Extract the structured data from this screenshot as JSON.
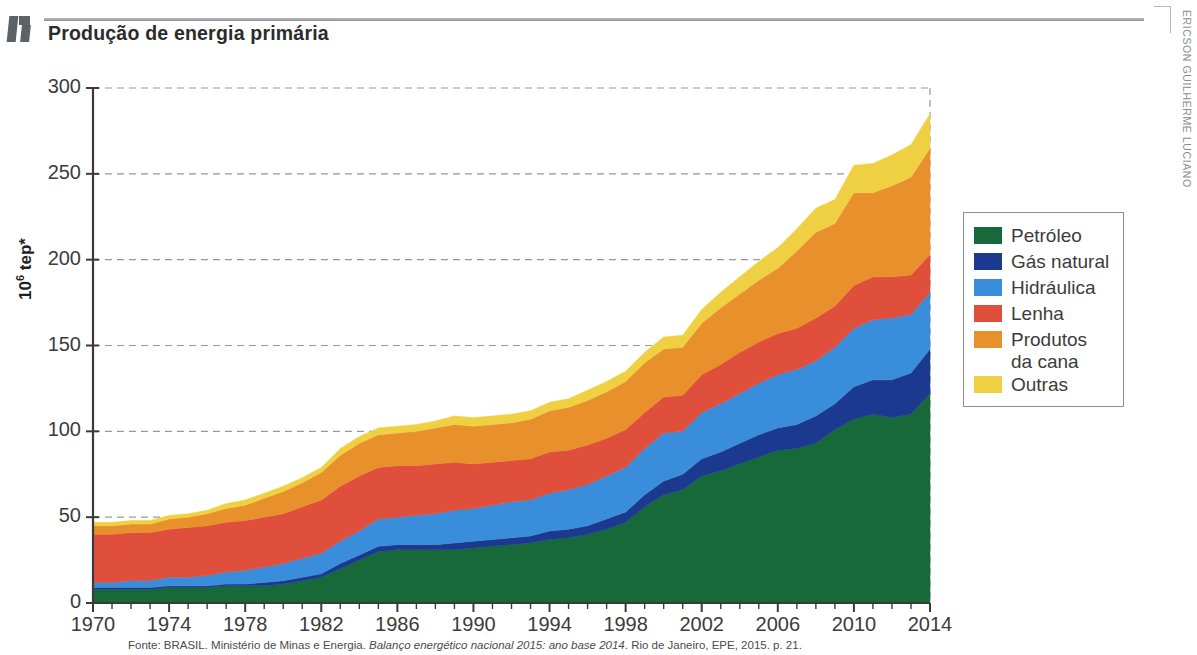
{
  "header": {
    "title": "Produção de energia primária",
    "corner_icon": "bookmark-corner-icon"
  },
  "credit": {
    "text": "ERICSON GUILHERME LUCIANO"
  },
  "source": {
    "prefix": "Fonte: BRASIL. Ministério de Minas e Energia. ",
    "italic": "Balanço energético nacional 2015: ano base 2014",
    "suffix": ". Rio de Janeiro, EPE, 2015. p. 21."
  },
  "legend": {
    "items": [
      {
        "label": "Petróleo",
        "color": "#17693a"
      },
      {
        "label": "Gás natural",
        "color": "#1b3a8f"
      },
      {
        "label": "Hidráulica",
        "color": "#3a8ddb"
      },
      {
        "label": "Lenha",
        "color": "#e04e3c"
      },
      {
        "label": "Produtos",
        "color": "#e8912c",
        "cont": "da cana"
      },
      {
        "label": "Outras",
        "color": "#f0d043"
      }
    ]
  },
  "chart_data": {
    "type": "area",
    "stacked": true,
    "title": "Produção de energia primária",
    "xlabel": "",
    "ylabel": "10⁶ tep*",
    "ylim": [
      0,
      300
    ],
    "yticks": [
      0,
      50,
      100,
      150,
      200,
      250,
      300
    ],
    "xlim": [
      1970,
      2014
    ],
    "xticks": [
      1970,
      1974,
      1978,
      1982,
      1986,
      1990,
      1994,
      1998,
      2002,
      2006,
      2010,
      2014
    ],
    "grid": "horizontal-dashed",
    "legend_position": "right",
    "x": [
      1970,
      1971,
      1972,
      1973,
      1974,
      1975,
      1976,
      1977,
      1978,
      1979,
      1980,
      1981,
      1982,
      1983,
      1984,
      1985,
      1986,
      1987,
      1988,
      1989,
      1990,
      1991,
      1992,
      1993,
      1994,
      1995,
      1996,
      1997,
      1998,
      1999,
      2000,
      2001,
      2002,
      2003,
      2004,
      2005,
      2006,
      2007,
      2008,
      2009,
      2010,
      2011,
      2012,
      2013,
      2014
    ],
    "series": [
      {
        "name": "Petróleo",
        "color": "#17693a",
        "values": [
          8,
          8,
          8,
          8,
          9,
          9,
          9,
          10,
          10,
          10,
          11,
          13,
          15,
          20,
          25,
          30,
          31,
          31,
          31,
          31,
          32,
          33,
          34,
          35,
          37,
          38,
          40,
          43,
          47,
          56,
          63,
          66,
          74,
          77,
          81,
          85,
          89,
          90,
          93,
          101,
          107,
          110,
          108,
          110,
          122
        ]
      },
      {
        "name": "Gás natural",
        "color": "#1b3a8f",
        "values": [
          1,
          1,
          1,
          1,
          1,
          1,
          1,
          1,
          1,
          2,
          2,
          2,
          2,
          3,
          3,
          3,
          3,
          3,
          3,
          4,
          4,
          4,
          4,
          4,
          5,
          5,
          5,
          6,
          6,
          7,
          8,
          9,
          10,
          11,
          12,
          13,
          13,
          14,
          16,
          15,
          19,
          20,
          22,
          24,
          26
        ]
      },
      {
        "name": "Hidráulica",
        "color": "#3a8ddb",
        "values": [
          3,
          3,
          4,
          4,
          5,
          5,
          6,
          7,
          8,
          9,
          10,
          11,
          12,
          13,
          14,
          16,
          16,
          17,
          18,
          19,
          19,
          20,
          21,
          21,
          22,
          23,
          24,
          25,
          26,
          27,
          28,
          25,
          27,
          28,
          29,
          30,
          31,
          32,
          32,
          33,
          34,
          35,
          36,
          34,
          33
        ]
      },
      {
        "name": "Lenha",
        "color": "#e04e3c",
        "values": [
          28,
          28,
          28,
          28,
          28,
          29,
          29,
          29,
          29,
          29,
          29,
          30,
          31,
          32,
          32,
          30,
          30,
          29,
          29,
          28,
          26,
          25,
          24,
          24,
          24,
          23,
          23,
          22,
          22,
          21,
          21,
          21,
          22,
          23,
          24,
          24,
          24,
          24,
          25,
          24,
          25,
          25,
          24,
          23,
          22
        ]
      },
      {
        "name": "Produtos da cana",
        "color": "#e8912c",
        "values": [
          5,
          5,
          5,
          5,
          6,
          6,
          7,
          8,
          9,
          11,
          13,
          14,
          16,
          18,
          19,
          19,
          19,
          20,
          21,
          22,
          22,
          22,
          22,
          23,
          24,
          25,
          26,
          27,
          28,
          29,
          28,
          28,
          30,
          33,
          34,
          36,
          38,
          45,
          50,
          48,
          54,
          49,
          53,
          57,
          62
        ]
      },
      {
        "name": "Outras",
        "color": "#f0d043",
        "values": [
          2,
          2,
          2,
          2,
          2,
          2,
          2,
          3,
          3,
          3,
          3,
          3,
          3,
          4,
          4,
          4,
          4,
          4,
          4,
          5,
          5,
          5,
          5,
          5,
          5,
          5,
          6,
          6,
          6,
          6,
          7,
          7,
          8,
          9,
          10,
          11,
          12,
          13,
          14,
          14,
          16,
          17,
          18,
          19,
          20
        ]
      }
    ]
  }
}
